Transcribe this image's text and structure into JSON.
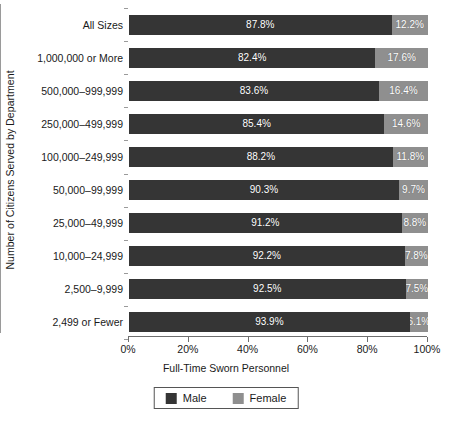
{
  "chart_data": {
    "type": "bar",
    "orientation": "horizontal",
    "stacked": true,
    "normalized": true,
    "title": "",
    "xlabel": "Full-Time Sworn Personnel",
    "ylabel": "Number of Citizens Served by Department",
    "xlim": [
      0,
      100
    ],
    "grid": false,
    "legend_position": "bottom",
    "xticks": [
      0,
      20,
      40,
      60,
      80,
      100
    ],
    "xticklabels": [
      "0%",
      "20%",
      "40%",
      "60%",
      "80%",
      "100%"
    ],
    "categories": [
      "All Sizes",
      "1,000,000 or More",
      "500,000–999,999",
      "250,000–499,999",
      "100,000–249,999",
      "50,000–99,999",
      "25,000–49,999",
      "10,000–24,999",
      "2,500–9,999",
      "2,499 or Fewer"
    ],
    "series": [
      {
        "name": "Male",
        "color": "#353535",
        "values": [
          87.8,
          82.4,
          83.6,
          85.4,
          88.2,
          90.3,
          91.2,
          92.2,
          92.5,
          93.9
        ],
        "labels": [
          "87.8%",
          "82.4%",
          "83.6%",
          "85.4%",
          "88.2%",
          "90.3%",
          "91.2%",
          "92.2%",
          "92.5%",
          "93.9%"
        ]
      },
      {
        "name": "Female",
        "color": "#8f8f8f",
        "values": [
          12.2,
          17.6,
          16.4,
          14.6,
          11.8,
          9.7,
          8.8,
          7.8,
          7.5,
          6.1
        ],
        "labels": [
          "12.2%",
          "17.6%",
          "16.4%",
          "14.6%",
          "11.8%",
          "9.7%",
          "8.8%",
          "7.8%",
          "7.5%",
          "6.1%"
        ]
      }
    ]
  },
  "legend": {
    "items": [
      {
        "label": "Male",
        "color": "#353535"
      },
      {
        "label": "Female",
        "color": "#8f8f8f"
      }
    ]
  }
}
